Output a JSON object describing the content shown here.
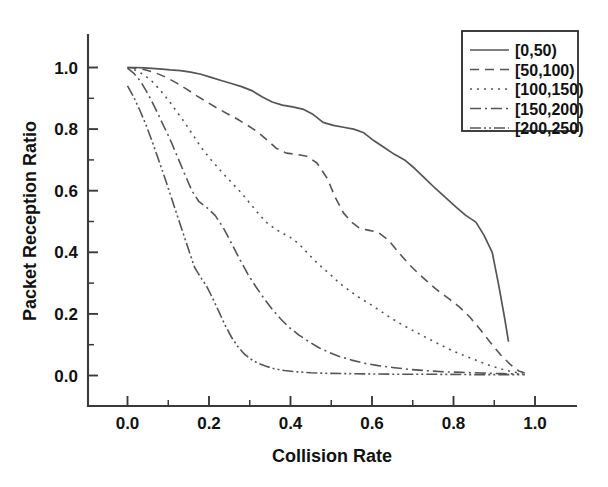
{
  "chart_data": {
    "type": "line",
    "title": "",
    "xlabel": "Collision Rate",
    "ylabel": "Packet Reception Ratio",
    "xlim": [
      -0.04,
      1.1
    ],
    "ylim": [
      -0.04,
      1.08
    ],
    "xticks": [
      0.0,
      0.2,
      0.4,
      0.6,
      0.8,
      1.0
    ],
    "xticklabels": [
      "0.0",
      "0.2",
      "0.4",
      "0.6",
      "0.8",
      "1.0"
    ],
    "yticks": [
      0.0,
      0.2,
      0.4,
      0.6,
      0.8,
      1.0
    ],
    "yticklabels": [
      "0.0",
      "0.2",
      "0.4",
      "0.6",
      "0.8",
      "1.0"
    ],
    "minor_ticks": true,
    "grid": false,
    "legend_position": "top-right",
    "line_color": "#555555",
    "axis_color": "#3a3a3a",
    "series": [
      {
        "name": "[0,50)",
        "dash": "solid",
        "dasharray": "",
        "width": 1.7,
        "points": [
          [
            0.0,
            1.0
          ],
          [
            0.02,
            1.0
          ],
          [
            0.04,
            0.999
          ],
          [
            0.06,
            0.997
          ],
          [
            0.085,
            0.995
          ],
          [
            0.105,
            0.992
          ],
          [
            0.13,
            0.99
          ],
          [
            0.155,
            0.985
          ],
          [
            0.18,
            0.978
          ],
          [
            0.205,
            0.968
          ],
          [
            0.23,
            0.958
          ],
          [
            0.255,
            0.948
          ],
          [
            0.28,
            0.938
          ],
          [
            0.305,
            0.925
          ],
          [
            0.33,
            0.905
          ],
          [
            0.355,
            0.888
          ],
          [
            0.38,
            0.878
          ],
          [
            0.405,
            0.872
          ],
          [
            0.43,
            0.865
          ],
          [
            0.455,
            0.848
          ],
          [
            0.48,
            0.822
          ],
          [
            0.505,
            0.812
          ],
          [
            0.53,
            0.806
          ],
          [
            0.555,
            0.8
          ],
          [
            0.58,
            0.788
          ],
          [
            0.605,
            0.762
          ],
          [
            0.63,
            0.74
          ],
          [
            0.655,
            0.718
          ],
          [
            0.68,
            0.7
          ],
          [
            0.705,
            0.672
          ],
          [
            0.73,
            0.64
          ],
          [
            0.755,
            0.608
          ],
          [
            0.78,
            0.578
          ],
          [
            0.805,
            0.548
          ],
          [
            0.83,
            0.52
          ],
          [
            0.855,
            0.498
          ],
          [
            0.875,
            0.455
          ],
          [
            0.895,
            0.4
          ],
          [
            0.91,
            0.3
          ],
          [
            0.925,
            0.19
          ],
          [
            0.935,
            0.11
          ]
        ]
      },
      {
        "name": "[50,100)",
        "dash": "dashed",
        "dasharray": "9 6",
        "width": 1.6,
        "points": [
          [
            0.0,
            1.0
          ],
          [
            0.02,
            0.998
          ],
          [
            0.045,
            0.992
          ],
          [
            0.07,
            0.982
          ],
          [
            0.095,
            0.968
          ],
          [
            0.12,
            0.95
          ],
          [
            0.145,
            0.93
          ],
          [
            0.17,
            0.908
          ],
          [
            0.195,
            0.888
          ],
          [
            0.22,
            0.868
          ],
          [
            0.245,
            0.85
          ],
          [
            0.27,
            0.832
          ],
          [
            0.295,
            0.812
          ],
          [
            0.32,
            0.79
          ],
          [
            0.345,
            0.762
          ],
          [
            0.365,
            0.738
          ],
          [
            0.39,
            0.722
          ],
          [
            0.415,
            0.718
          ],
          [
            0.44,
            0.712
          ],
          [
            0.465,
            0.69
          ],
          [
            0.49,
            0.64
          ],
          [
            0.51,
            0.578
          ],
          [
            0.53,
            0.528
          ],
          [
            0.55,
            0.498
          ],
          [
            0.57,
            0.478
          ],
          [
            0.59,
            0.472
          ],
          [
            0.615,
            0.465
          ],
          [
            0.64,
            0.44
          ],
          [
            0.665,
            0.4
          ],
          [
            0.69,
            0.362
          ],
          [
            0.715,
            0.33
          ],
          [
            0.74,
            0.3
          ],
          [
            0.765,
            0.272
          ],
          [
            0.79,
            0.248
          ],
          [
            0.815,
            0.222
          ],
          [
            0.84,
            0.19
          ],
          [
            0.865,
            0.15
          ],
          [
            0.89,
            0.108
          ],
          [
            0.915,
            0.068
          ],
          [
            0.94,
            0.035
          ],
          [
            0.96,
            0.015
          ],
          [
            0.975,
            0.008
          ]
        ]
      },
      {
        "name": "[100,150)",
        "dash": "dotted",
        "dasharray": "2 5",
        "width": 1.6,
        "points": [
          [
            0.0,
            1.0
          ],
          [
            0.018,
            0.992
          ],
          [
            0.038,
            0.978
          ],
          [
            0.058,
            0.958
          ],
          [
            0.078,
            0.93
          ],
          [
            0.098,
            0.898
          ],
          [
            0.118,
            0.862
          ],
          [
            0.14,
            0.822
          ],
          [
            0.16,
            0.782
          ],
          [
            0.18,
            0.742
          ],
          [
            0.2,
            0.708
          ],
          [
            0.22,
            0.678
          ],
          [
            0.24,
            0.648
          ],
          [
            0.26,
            0.62
          ],
          [
            0.28,
            0.592
          ],
          [
            0.3,
            0.56
          ],
          [
            0.32,
            0.528
          ],
          [
            0.34,
            0.498
          ],
          [
            0.36,
            0.478
          ],
          [
            0.38,
            0.462
          ],
          [
            0.4,
            0.448
          ],
          [
            0.42,
            0.428
          ],
          [
            0.44,
            0.4
          ],
          [
            0.46,
            0.372
          ],
          [
            0.48,
            0.348
          ],
          [
            0.5,
            0.325
          ],
          [
            0.52,
            0.3
          ],
          [
            0.545,
            0.275
          ],
          [
            0.57,
            0.252
          ],
          [
            0.595,
            0.232
          ],
          [
            0.62,
            0.21
          ],
          [
            0.645,
            0.188
          ],
          [
            0.67,
            0.168
          ],
          [
            0.695,
            0.15
          ],
          [
            0.72,
            0.132
          ],
          [
            0.745,
            0.115
          ],
          [
            0.77,
            0.098
          ],
          [
            0.795,
            0.082
          ],
          [
            0.82,
            0.068
          ],
          [
            0.845,
            0.055
          ],
          [
            0.87,
            0.042
          ],
          [
            0.895,
            0.03
          ],
          [
            0.92,
            0.02
          ],
          [
            0.945,
            0.012
          ],
          [
            0.97,
            0.006
          ]
        ]
      },
      {
        "name": "[150,200)",
        "dash": "dashdot",
        "dasharray": "11 4 2 4",
        "width": 1.6,
        "points": [
          [
            0.0,
            0.998
          ],
          [
            0.015,
            0.982
          ],
          [
            0.032,
            0.955
          ],
          [
            0.05,
            0.915
          ],
          [
            0.068,
            0.868
          ],
          [
            0.086,
            0.818
          ],
          [
            0.104,
            0.768
          ],
          [
            0.122,
            0.712
          ],
          [
            0.14,
            0.655
          ],
          [
            0.158,
            0.6
          ],
          [
            0.175,
            0.565
          ],
          [
            0.195,
            0.545
          ],
          [
            0.215,
            0.52
          ],
          [
            0.235,
            0.48
          ],
          [
            0.255,
            0.43
          ],
          [
            0.275,
            0.378
          ],
          [
            0.295,
            0.33
          ],
          [
            0.315,
            0.288
          ],
          [
            0.335,
            0.25
          ],
          [
            0.355,
            0.215
          ],
          [
            0.375,
            0.185
          ],
          [
            0.395,
            0.158
          ],
          [
            0.42,
            0.132
          ],
          [
            0.445,
            0.11
          ],
          [
            0.47,
            0.09
          ],
          [
            0.495,
            0.075
          ],
          [
            0.52,
            0.062
          ],
          [
            0.55,
            0.05
          ],
          [
            0.58,
            0.04
          ],
          [
            0.615,
            0.032
          ],
          [
            0.65,
            0.026
          ],
          [
            0.69,
            0.02
          ],
          [
            0.73,
            0.016
          ],
          [
            0.775,
            0.012
          ],
          [
            0.82,
            0.01
          ],
          [
            0.87,
            0.008
          ],
          [
            0.92,
            0.006
          ],
          [
            0.96,
            0.005
          ]
        ]
      },
      {
        "name": "[200,250)",
        "dash": "dashdotdot",
        "dasharray": "11 3 2 3 2 3",
        "width": 1.6,
        "points": [
          [
            0.0,
            0.94
          ],
          [
            0.015,
            0.905
          ],
          [
            0.03,
            0.862
          ],
          [
            0.045,
            0.815
          ],
          [
            0.06,
            0.762
          ],
          [
            0.075,
            0.705
          ],
          [
            0.09,
            0.648
          ],
          [
            0.105,
            0.588
          ],
          [
            0.12,
            0.528
          ],
          [
            0.135,
            0.468
          ],
          [
            0.15,
            0.408
          ],
          [
            0.165,
            0.35
          ],
          [
            0.18,
            0.318
          ],
          [
            0.195,
            0.288
          ],
          [
            0.21,
            0.248
          ],
          [
            0.225,
            0.205
          ],
          [
            0.24,
            0.162
          ],
          [
            0.255,
            0.125
          ],
          [
            0.27,
            0.095
          ],
          [
            0.285,
            0.072
          ],
          [
            0.3,
            0.055
          ],
          [
            0.32,
            0.04
          ],
          [
            0.34,
            0.03
          ],
          [
            0.36,
            0.022
          ],
          [
            0.385,
            0.016
          ],
          [
            0.415,
            0.012
          ],
          [
            0.45,
            0.009
          ],
          [
            0.49,
            0.007
          ],
          [
            0.54,
            0.006
          ],
          [
            0.6,
            0.005
          ],
          [
            0.67,
            0.004
          ],
          [
            0.75,
            0.004
          ],
          [
            0.84,
            0.003
          ],
          [
            0.93,
            0.003
          ],
          [
            0.975,
            0.003
          ]
        ]
      }
    ]
  },
  "legend": {
    "items": [
      {
        "label": "[0,50)"
      },
      {
        "label": "[50,100)"
      },
      {
        "label": "[100,150)"
      },
      {
        "label": "[150,200)"
      },
      {
        "label": "[200,250)"
      }
    ]
  }
}
